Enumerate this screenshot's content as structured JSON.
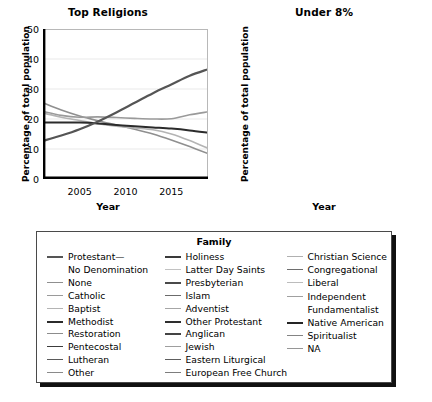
{
  "chart_data": [
    {
      "type": "line",
      "title": "Top Religions",
      "xlabel": "Year",
      "ylabel": "Percentage of total population",
      "xlim": [
        2001,
        2019
      ],
      "ylim": [
        0,
        50
      ],
      "xticks": [
        2005,
        2010,
        2015
      ],
      "yticks": [
        0,
        10,
        20,
        30,
        40,
        50
      ],
      "grid": "horizontal",
      "legend_position": "below-both-panels",
      "x": [
        2001,
        2003,
        2005,
        2007,
        2009,
        2011,
        2013,
        2015,
        2017,
        2019
      ],
      "series": [
        {
          "name": "None",
          "color": "#8f8f8f",
          "width": 1.6,
          "values": [
            25.4,
            23.0,
            21.0,
            19.4,
            18.0,
            16.6,
            15.0,
            13.0,
            10.8,
            8.5
          ]
        },
        {
          "name": "Catholic",
          "color": "#9a9a9a",
          "width": 1.6,
          "values": [
            22.5,
            21.2,
            20.6,
            20.7,
            20.5,
            20.2,
            20.0,
            20.1,
            21.4,
            22.4
          ]
        },
        {
          "name": "Baptist",
          "color": "#b4b4b4",
          "width": 1.6,
          "values": [
            22.0,
            20.6,
            19.5,
            18.4,
            17.6,
            17.0,
            16.4,
            15.0,
            12.8,
            10.2
          ]
        },
        {
          "name": "Methodist",
          "color": "#2b2b2b",
          "width": 2.0,
          "values": [
            18.8,
            18.8,
            18.8,
            18.5,
            18.0,
            17.6,
            17.2,
            16.8,
            16.2,
            15.4
          ]
        },
        {
          "name": "Protestant—No Denomination",
          "color": "#555555",
          "width": 2.2,
          "values": [
            12.7,
            14.5,
            16.6,
            19.2,
            22.2,
            25.4,
            28.6,
            31.5,
            34.4,
            36.6
          ]
        }
      ]
    },
    {
      "type": "line",
      "title": "Under 8%",
      "xlabel": "Year",
      "ylabel": "Percentage of total population",
      "xlim": [
        2001,
        2019
      ],
      "ylim": [
        0,
        8
      ],
      "xticks": [
        2005,
        2010,
        2015
      ],
      "yticks": [
        0,
        2,
        4,
        6,
        8
      ],
      "grid": "horizontal",
      "legend_position": "below-both-panels",
      "x": [
        2001,
        2003,
        2005,
        2007,
        2009,
        2011,
        2013,
        2015,
        2017,
        2019
      ],
      "series": [
        {
          "name": "Latter Day Saints",
          "color": "#a9a9a9",
          "width": 1.6,
          "values": [
            4.0,
            5.9,
            7.0,
            7.7,
            7.6,
            6.9,
            6.3,
            5.6,
            4.8,
            3.5
          ]
        },
        {
          "name": "Native American",
          "color": "#252525",
          "width": 1.9,
          "values": [
            3.4,
            3.1,
            2.8,
            2.5,
            2.3,
            2.0,
            1.8,
            1.6,
            1.4,
            1.2
          ]
        },
        {
          "name": "Presbyterian",
          "color": "#4a4a4a",
          "width": 1.6,
          "values": [
            2.4,
            2.3,
            2.2,
            2.1,
            2.0,
            1.9,
            1.7,
            1.5,
            1.4,
            1.3
          ]
        },
        {
          "name": "Lutheran",
          "color": "#5a5a5a",
          "width": 1.6,
          "values": [
            2.3,
            2.2,
            2.1,
            2.0,
            1.9,
            1.8,
            1.7,
            1.5,
            1.3,
            1.2
          ]
        },
        {
          "name": "Pentecostal",
          "color": "#3c3c3c",
          "width": 1.6,
          "values": [
            2.0,
            2.0,
            2.0,
            2.0,
            1.9,
            1.8,
            1.7,
            1.6,
            1.4,
            1.3
          ]
        },
        {
          "name": "Other Protestant",
          "color": "#2e2e2e",
          "width": 1.8,
          "values": [
            1.1,
            1.3,
            1.5,
            1.6,
            1.6,
            1.5,
            1.4,
            1.4,
            1.3,
            1.1
          ]
        },
        {
          "name": "Restoration",
          "color": "#8c8c8c",
          "width": 1.6,
          "values": [
            1.0,
            1.1,
            1.9,
            2.0,
            1.9,
            1.7,
            1.6,
            1.4,
            1.3,
            1.2
          ]
        },
        {
          "name": "Holiness",
          "color": "#3a3a3a",
          "width": 1.6,
          "values": [
            1.0,
            1.1,
            1.2,
            1.3,
            1.3,
            1.3,
            1.3,
            1.3,
            1.2,
            1.1
          ]
        },
        {
          "name": "Anglican",
          "color": "#444444",
          "width": 1.6,
          "values": [
            0.9,
            0.9,
            0.9,
            0.9,
            0.9,
            0.9,
            0.9,
            0.9,
            1.0,
            1.1
          ]
        },
        {
          "name": "Islam",
          "color": "#6b6b6b",
          "width": 1.6,
          "values": [
            0.8,
            0.8,
            0.8,
            0.8,
            0.8,
            0.8,
            0.8,
            0.9,
            1.0,
            1.1
          ]
        },
        {
          "name": "Jewish",
          "color": "#9e9e9e",
          "width": 1.6,
          "values": [
            0.7,
            0.7,
            0.7,
            0.7,
            0.7,
            0.7,
            0.7,
            0.7,
            0.6,
            0.6
          ]
        },
        {
          "name": "Eastern Liturgical",
          "color": "#5e5e5e",
          "width": 1.6,
          "values": [
            0.6,
            0.6,
            0.6,
            0.6,
            0.6,
            0.6,
            0.6,
            0.6,
            0.6,
            0.7
          ]
        },
        {
          "name": "European Free Church",
          "color": "#7d7d7d",
          "width": 1.6,
          "values": [
            0.5,
            0.5,
            0.6,
            0.7,
            0.8,
            0.8,
            0.7,
            0.6,
            0.5,
            0.4
          ]
        },
        {
          "name": "Adventist",
          "color": "#a6a6a6",
          "width": 1.6,
          "values": [
            0.45,
            0.45,
            0.45,
            0.45,
            0.45,
            0.45,
            0.45,
            0.45,
            0.45,
            0.45
          ]
        },
        {
          "name": "Christian Science",
          "color": "#b0b0b0",
          "width": 1.6,
          "values": [
            0.4,
            0.4,
            0.4,
            0.4,
            0.4,
            0.4,
            0.35,
            0.3,
            0.3,
            0.3
          ]
        },
        {
          "name": "Congregational",
          "color": "#6e6e6e",
          "width": 1.6,
          "values": [
            0.35,
            0.35,
            0.35,
            0.35,
            0.35,
            0.35,
            0.35,
            0.35,
            0.35,
            0.35
          ]
        },
        {
          "name": "Liberal",
          "color": "#bcbcbc",
          "width": 1.6,
          "values": [
            0.3,
            0.3,
            0.3,
            0.3,
            0.3,
            0.3,
            0.3,
            0.3,
            0.3,
            0.3
          ]
        },
        {
          "name": "Independent Fundamentalist",
          "color": "#a0a0a0",
          "width": 1.6,
          "values": [
            0.25,
            0.25,
            0.25,
            0.25,
            0.25,
            0.25,
            0.25,
            0.25,
            0.25,
            0.25
          ]
        },
        {
          "name": "Spiritualist",
          "color": "#848484",
          "width": 1.6,
          "values": [
            0.2,
            0.2,
            0.2,
            0.2,
            0.2,
            0.2,
            0.2,
            0.2,
            0.2,
            0.2
          ]
        },
        {
          "name": "NA",
          "color": "#969696",
          "width": 1.6,
          "values": [
            0.15,
            0.15,
            0.15,
            0.15,
            0.15,
            0.15,
            0.15,
            0.15,
            0.15,
            0.15
          ]
        },
        {
          "name": "Other",
          "color": "#8a8a8a",
          "width": 1.6,
          "values": [
            0.1,
            0.1,
            0.1,
            0.1,
            0.1,
            0.1,
            0.1,
            0.1,
            0.1,
            0.1
          ]
        }
      ]
    }
  ],
  "legend": {
    "title": "Family",
    "columns": [
      [
        {
          "label": "Protestant—",
          "color": "#555555",
          "width": 2.2,
          "continuation": false
        },
        {
          "label": "No Denomination",
          "color": "#555555",
          "width": 2.2,
          "continuation": true
        },
        {
          "label": "None",
          "color": "#8f8f8f",
          "width": 1.6,
          "continuation": false
        },
        {
          "label": "Catholic",
          "color": "#9a9a9a",
          "width": 1.6,
          "continuation": false
        },
        {
          "label": "Baptist",
          "color": "#b4b4b4",
          "width": 1.6,
          "continuation": false
        },
        {
          "label": "Methodist",
          "color": "#2b2b2b",
          "width": 2.4,
          "continuation": false
        },
        {
          "label": "Restoration",
          "color": "#8c8c8c",
          "width": 1.6,
          "continuation": false
        },
        {
          "label": "Pentecostal",
          "color": "#3c3c3c",
          "width": 1.8,
          "continuation": false
        },
        {
          "label": "Lutheran",
          "color": "#5a5a5a",
          "width": 1.8,
          "continuation": false
        },
        {
          "label": "Other",
          "color": "#8a8a8a",
          "width": 1.6,
          "continuation": false
        }
      ],
      [
        {
          "label": "Holiness",
          "color": "#3a3a3a",
          "width": 2.0,
          "continuation": false
        },
        {
          "label": "Latter Day Saints",
          "color": "#c2c2c2",
          "width": 1.6,
          "continuation": false
        },
        {
          "label": "Presbyterian",
          "color": "#4a4a4a",
          "width": 2.0,
          "continuation": false
        },
        {
          "label": "Islam",
          "color": "#6b6b6b",
          "width": 1.6,
          "continuation": false
        },
        {
          "label": "Adventist",
          "color": "#a6a6a6",
          "width": 1.6,
          "continuation": false
        },
        {
          "label": "Other Protestant",
          "color": "#2e2e2e",
          "width": 2.2,
          "continuation": false
        },
        {
          "label": "Anglican",
          "color": "#444444",
          "width": 2.0,
          "continuation": false
        },
        {
          "label": "Jewish",
          "color": "#9e9e9e",
          "width": 1.6,
          "continuation": false
        },
        {
          "label": "Eastern Liturgical",
          "color": "#5e5e5e",
          "width": 1.8,
          "continuation": false
        },
        {
          "label": "European Free Church",
          "color": "#7d7d7d",
          "width": 1.6,
          "continuation": false
        }
      ],
      [
        {
          "label": "Christian Science",
          "color": "#b0b0b0",
          "width": 1.6,
          "continuation": false
        },
        {
          "label": "Congregational",
          "color": "#6e6e6e",
          "width": 1.8,
          "continuation": false
        },
        {
          "label": "Liberal",
          "color": "#bcbcbc",
          "width": 1.6,
          "continuation": false
        },
        {
          "label": "Independent",
          "color": "#a0a0a0",
          "width": 1.6,
          "continuation": false
        },
        {
          "label": "Fundamentalist",
          "color": "#a0a0a0",
          "width": 1.6,
          "continuation": true
        },
        {
          "label": "Native American",
          "color": "#252525",
          "width": 2.4,
          "continuation": false
        },
        {
          "label": "Spiritualist",
          "color": "#848484",
          "width": 1.8,
          "continuation": false
        },
        {
          "label": "NA",
          "color": "#969696",
          "width": 1.6,
          "continuation": false
        }
      ]
    ]
  }
}
